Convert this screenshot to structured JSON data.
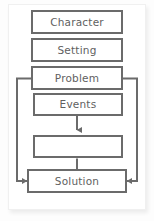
{
  "diagram": {
    "type": "flowchart",
    "orientation": "vertical",
    "colors": {
      "box_border": "#6b6b6b",
      "box_fill": "#ffffff",
      "text": "#5f5f5f",
      "connector": "#6b6b6b",
      "card_background": "#ffffff",
      "page_background": "#fdfdfd"
    },
    "nodes": [
      {
        "id": "character",
        "label": "Character"
      },
      {
        "id": "setting",
        "label": "Setting"
      },
      {
        "id": "problem",
        "label": "Problem"
      },
      {
        "id": "events",
        "label": "Events"
      },
      {
        "id": "blank",
        "label": ""
      },
      {
        "id": "solution",
        "label": "Solution"
      }
    ],
    "connectors": [
      {
        "id": "events-to-blank",
        "from": "events",
        "to": "blank",
        "style": "arrow-down"
      },
      {
        "id": "blank-to-solution",
        "from": "blank",
        "to": "solution",
        "style": "arrow-down"
      },
      {
        "id": "problem-left-loop",
        "from": "problem",
        "to": "solution",
        "style": "left-bypass-arrow"
      },
      {
        "id": "problem-right-loop",
        "from": "problem",
        "to": "solution",
        "style": "right-bypass-arrow"
      }
    ]
  }
}
